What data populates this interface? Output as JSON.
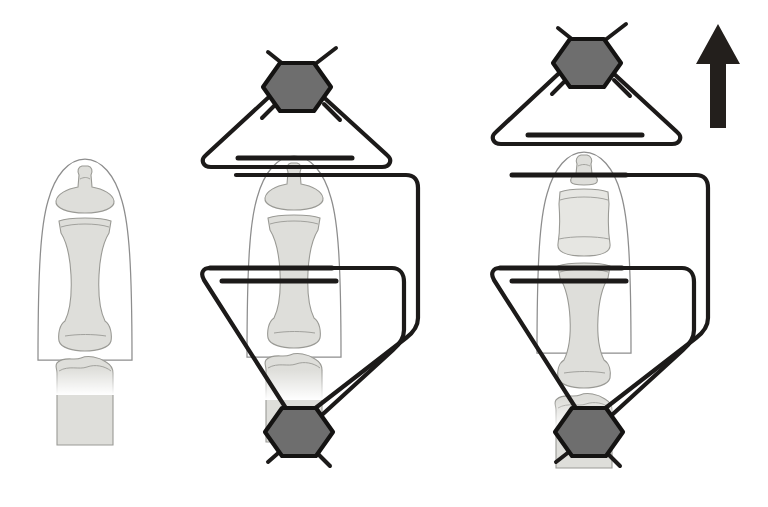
{
  "figure": {
    "kind": "medical-illustration",
    "title": "Distraction lengthening of the distal phalanx with a mini external fixator",
    "background_color": "#ffffff",
    "width": 768,
    "height": 507,
    "panel_count": 3
  },
  "palette": {
    "soft_tissue_outline": "#8d8d8d",
    "soft_tissue_fill": "#ffffff",
    "bone_fill": "#dededa",
    "bone_fill_light": "#e6e6e2",
    "bone_outline": "#9a9a95",
    "wire_stroke": "#1c1a19",
    "nut_fill": "#6e6e6e",
    "nut_stroke": "#141312",
    "arrow_fill": "#231f1c"
  },
  "panels": [
    {
      "id": "panel-a",
      "label": "untreated finger",
      "caption": "",
      "has_fixator": false,
      "has_arrow": false,
      "anatomy": {
        "segments": [
          {
            "name": "distal-phalanx",
            "state": "normal"
          },
          {
            "name": "middle-phalanx",
            "state": "normal"
          },
          {
            "name": "proximal-phalanx",
            "state": "normal"
          }
        ],
        "distal_phalanx_length_units": 1.0
      }
    },
    {
      "id": "panel-b",
      "label": "fixator applied, before distraction",
      "caption": "",
      "has_fixator": true,
      "has_arrow": false,
      "anatomy": {
        "segments": [
          {
            "name": "distal-phalanx",
            "state": "normal"
          },
          {
            "name": "middle-phalanx",
            "state": "normal"
          },
          {
            "name": "proximal-phalanx",
            "state": "normal"
          }
        ],
        "distal_phalanx_length_units": 1.0
      },
      "fixator": {
        "parts": [
          {
            "name": "proximal-hex-nut",
            "shape": "hexagon",
            "position": "top"
          },
          {
            "name": "distal-hex-nut",
            "shape": "hexagon",
            "position": "bottom"
          },
          {
            "name": "upper-k-wire",
            "shape": "transverse-wire"
          },
          {
            "name": "lower-k-wire",
            "shape": "transverse-wire"
          },
          {
            "name": "triangular-yoke",
            "shape": "triangle-frame"
          },
          {
            "name": "funnel-yoke",
            "shape": "v-frame"
          },
          {
            "name": "connecting-rod",
            "shape": "vertical-rod"
          }
        ],
        "wire_count": 2,
        "nut_count": 2
      }
    },
    {
      "id": "panel-c",
      "label": "after distraction, distal phalanx lengthened",
      "caption": "",
      "has_fixator": true,
      "has_arrow": true,
      "anatomy": {
        "segments": [
          {
            "name": "distal-phalanx",
            "state": "distracted"
          },
          {
            "name": "middle-phalanx",
            "state": "normal"
          },
          {
            "name": "proximal-phalanx",
            "state": "normal"
          }
        ],
        "distal_phalanx_length_units": 1.85
      },
      "fixator": {
        "parts": [
          {
            "name": "proximal-hex-nut",
            "shape": "hexagon",
            "position": "top"
          },
          {
            "name": "distal-hex-nut",
            "shape": "hexagon",
            "position": "bottom"
          },
          {
            "name": "upper-k-wire",
            "shape": "transverse-wire"
          },
          {
            "name": "lower-k-wire",
            "shape": "transverse-wire"
          },
          {
            "name": "triangular-yoke",
            "shape": "triangle-frame"
          },
          {
            "name": "funnel-yoke",
            "shape": "v-frame"
          },
          {
            "name": "connecting-rod",
            "shape": "vertical-rod"
          }
        ],
        "wire_count": 2,
        "nut_count": 2
      }
    }
  ],
  "annotations": {
    "direction_arrow": {
      "name": "distraction-direction-arrow",
      "direction": "up",
      "meaning": "direction of distraction / lengthening",
      "color": "#231f1c"
    }
  },
  "icons": {
    "hexagon_nut": "hexagon-nut-icon",
    "up_arrow": "up-arrow-icon",
    "k_wire": "k-wire-icon"
  },
  "text_labels": []
}
